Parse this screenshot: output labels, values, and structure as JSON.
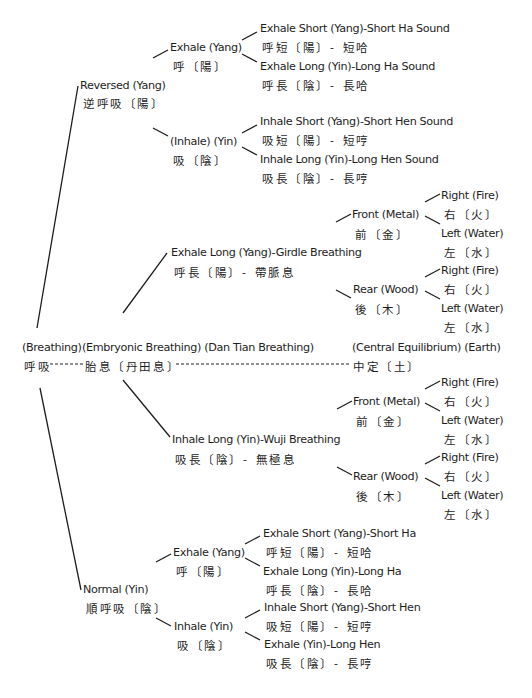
{
  "root": {
    "en": "(Breathing)",
    "zh": "呼吸"
  },
  "reversed": {
    "en": "Reversed (Yang)",
    "zh": "逆呼吸〔陽〕",
    "exhale": {
      "en": "Exhale (Yang)",
      "zh": "呼〔陽〕",
      "leaves": [
        {
          "en": "Exhale Short (Yang)-Short Ha Sound",
          "zh": "呼短〔陽〕- 短哈"
        },
        {
          "en": "Exhale Long (Yin)-Long Ha Sound",
          "zh": "呼長〔陰〕- 長哈"
        }
      ]
    },
    "inhale": {
      "en": "(Inhale) (Yin)",
      "zh": "吸〔陰〕",
      "leaves": [
        {
          "en": "Inhale Short (Yang)-Short Hen Sound",
          "zh": "吸短〔陽〕- 短哼"
        },
        {
          "en": "Inhale Long (Yin)-Long Hen Sound",
          "zh": "吸長〔陰〕- 長哼"
        }
      ]
    }
  },
  "embryonic": {
    "en": "(Embryonic Breathing) (Dan Tian Breathing)",
    "zh": "胎息〔丹田息〕",
    "center": {
      "en": "(Central Equilibrium) (Earth)",
      "zh": "中定〔土〕"
    },
    "girdle": {
      "en": "Exhale Long (Yang)-Girdle Breathing",
      "zh": "呼長〔陽〕- 帶脈息",
      "front": {
        "en": "Front (Metal)",
        "zh": "前〔金〕",
        "leaves": [
          {
            "en": "Right (Fire)",
            "zh": "右〔火〕"
          },
          {
            "en": "Left (Water)",
            "zh": "左〔水〕"
          }
        ]
      },
      "rear": {
        "en": "Rear (Wood)",
        "zh": "後〔木〕",
        "leaves": [
          {
            "en": "Right (Fire)",
            "zh": "右〔火〕"
          },
          {
            "en": "Left (Water)",
            "zh": "左〔水〕"
          }
        ]
      }
    },
    "wuji": {
      "en": "Inhale Long (Yin)-Wuji Breathing",
      "zh": "吸長〔陰〕- 無極息",
      "front": {
        "en": "Front (Metal)",
        "zh": "前〔金〕",
        "leaves": [
          {
            "en": "Right (Fire)",
            "zh": "右〔火〕"
          },
          {
            "en": "Left (Water)",
            "zh": "左〔水〕"
          }
        ]
      },
      "rear": {
        "en": "Rear (Wood)",
        "zh": "後〔木〕",
        "leaves": [
          {
            "en": "Right (Fire)",
            "zh": "右〔火〕"
          },
          {
            "en": "Left (Water)",
            "zh": "左〔水〕"
          }
        ]
      }
    }
  },
  "normal": {
    "en": "Normal (Yin)",
    "zh": "順呼吸〔陰〕",
    "exhale": {
      "en": "Exhale (Yang)",
      "zh": "呼〔陽〕",
      "leaves": [
        {
          "en": "Exhale Short (Yang)-Short Ha",
          "zh": "呼短〔陽〕- 短哈"
        },
        {
          "en": "Exhale Long (Yin)-Long Ha",
          "zh": "呼長〔陰〕- 長哈"
        }
      ]
    },
    "inhale": {
      "en": "Inhale (Yin)",
      "zh": "吸〔陰〕",
      "leaves": [
        {
          "en": "Inhale Short (Yang)-Short Hen",
          "zh": "吸短〔陽〕- 短哼"
        },
        {
          "en": "Exhale (Yin)-Long Hen",
          "zh": "吸長〔陰〕- 長哼"
        }
      ]
    }
  }
}
